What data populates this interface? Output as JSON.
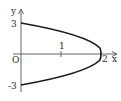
{
  "diagram": {
    "type": "function-graph",
    "axes": {
      "x_label": "x",
      "y_label": "y",
      "origin_label": "O"
    },
    "ticks": {
      "x": [
        "1",
        "2"
      ],
      "y": [
        "3",
        "-3"
      ]
    },
    "curve": {
      "vertex": [
        2,
        0
      ],
      "endpoints": [
        [
          0,
          3
        ],
        [
          0,
          -3
        ]
      ],
      "color": "#1a1a1a"
    },
    "colors": {
      "axis": "#555555",
      "curve": "#1a1a1a",
      "text": "#2a2a2a"
    }
  }
}
